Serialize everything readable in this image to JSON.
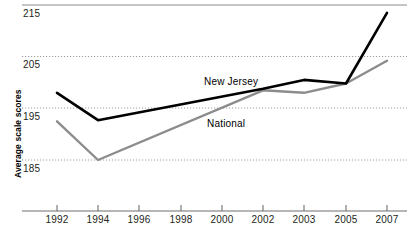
{
  "chart_data": {
    "type": "line",
    "title": "",
    "xlabel": "",
    "ylabel": "Average scale scores",
    "x": [
      "1992",
      "1994",
      "1996",
      "1998",
      "2000",
      "2002",
      "2003",
      "2005",
      "2007"
    ],
    "xtick_labels": [
      "1992",
      "1994",
      "1996",
      "1998",
      "2000",
      "2002",
      "2003",
      "2005",
      "2007"
    ],
    "ytick_labels": [
      "215",
      "205",
      "195",
      "185"
    ],
    "ytick_values": [
      215,
      205,
      195,
      185
    ],
    "ylim": [
      180,
      216
    ],
    "grid": "horizontal-dotted",
    "legend": "inline-annotations",
    "series": [
      {
        "name": "New Jersey",
        "color": "#000000",
        "points": [
          {
            "x": "1992",
            "y": 198.0
          },
          {
            "x": "1994",
            "y": 192.7
          },
          {
            "x": "2002",
            "y": 198.8
          },
          {
            "x": "2003",
            "y": 200.5
          },
          {
            "x": "2005",
            "y": 199.8
          },
          {
            "x": "2007",
            "y": 213.5
          }
        ]
      },
      {
        "name": "National",
        "color": "#8c8c8c",
        "points": [
          {
            "x": "1992",
            "y": 192.5
          },
          {
            "x": "1994",
            "y": 185.0
          },
          {
            "x": "2002",
            "y": 198.5
          },
          {
            "x": "2003",
            "y": 198.0
          },
          {
            "x": "2005",
            "y": 199.8
          },
          {
            "x": "2007",
            "y": 204.2
          }
        ]
      }
    ],
    "annotations": [
      {
        "text": "New Jersey",
        "series": "New Jersey"
      },
      {
        "text": "National",
        "series": "National"
      }
    ]
  },
  "axis": {
    "y_title": "Average scale scores",
    "y_labels": [
      "215",
      "205",
      "195",
      "185"
    ],
    "x_labels": [
      "1992",
      "1994",
      "1996",
      "1998",
      "2000",
      "2002",
      "2003",
      "2005",
      "2007"
    ]
  },
  "labels": {
    "new_jersey": "New Jersey",
    "national": "National"
  },
  "colors": {
    "new_jersey_line": "#000000",
    "national_line": "#8c8c8c",
    "gridline": "#a8a8a8",
    "axis": "#6e6e6e",
    "text": "#231f20"
  }
}
